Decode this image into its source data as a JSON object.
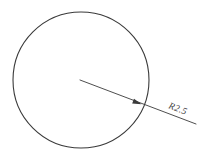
{
  "drawing": {
    "title": "Circle radius dimension drawing",
    "background_color": "#ffffff",
    "line_color": "#3a3a3a",
    "width": 209,
    "height": 161,
    "circle": {
      "name": "main-circle",
      "center_x": 81,
      "center_y": 80,
      "radius_px": 68,
      "stroke_width": 1.1
    },
    "leader": {
      "name": "radius-leader-line",
      "start_x": 80,
      "start_y": 80,
      "end_x": 196,
      "end_y": 124,
      "angle_deg": 20.8,
      "stroke_width": 0.9
    },
    "arrowhead": {
      "name": "radius-arrowhead",
      "tip_x": 141.5,
      "tip_y": 104.3,
      "length": 9,
      "half_width": 2.6
    },
    "label": {
      "name": "radius-dimension-label",
      "text": "R2.5",
      "value": 2.5,
      "symbol": "R",
      "x": 168,
      "y": 108,
      "rotation_deg": 20.8,
      "font_size_px": 9.5
    }
  }
}
